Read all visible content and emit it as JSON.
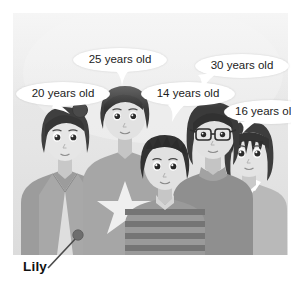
{
  "image": {
    "kind": "photo-illustration",
    "description": "Group of five cartoon people standing together against a plain light grey background",
    "panel_background": "#e6e6e6",
    "page_background": "#ffffff"
  },
  "callouts": {
    "bubbles": [
      {
        "id": "bubble-20",
        "label": "20 years old",
        "subject": "woman-with-bun",
        "x": 16,
        "y": 82,
        "w": 94,
        "h": 24,
        "tail_x": 62,
        "clipped": false
      },
      {
        "id": "bubble-25",
        "label": "25 years old",
        "subject": "tall-man",
        "x": 73,
        "y": 48,
        "w": 94,
        "h": 24,
        "tail_x": 120,
        "clipped": false
      },
      {
        "id": "bubble-14",
        "label": "14 years old",
        "subject": "boy-striped-shirt",
        "x": 141,
        "y": 82,
        "w": 94,
        "h": 24,
        "tail_x": 182,
        "clipped": false
      },
      {
        "id": "bubble-30",
        "label": "30 years old",
        "subject": "woman-with-glasses",
        "x": 195,
        "y": 54,
        "w": 94,
        "h": 24,
        "tail_x": 214,
        "clipped": false
      },
      {
        "id": "bubble-16",
        "label": "16 years old",
        "subject": "girl-bob-haircut",
        "x": 224,
        "y": 100,
        "w": 94,
        "h": 24,
        "tail_x": 250,
        "clipped": true
      }
    ]
  },
  "annotation": {
    "name_label": "Lily",
    "pointer_target": "leftmost-woman-shoulder",
    "dot_color": "#707070",
    "line_color": "#4a4a4a"
  },
  "people": [
    {
      "id": "woman-with-bun",
      "age_label": "20 years old",
      "is_named": true,
      "name": "Lily",
      "hair": "bun",
      "outfit": "light jacket"
    },
    {
      "id": "tall-man",
      "age_label": "25 years old",
      "is_named": false,
      "name": "",
      "hair": "short",
      "outfit": "star t-shirt"
    },
    {
      "id": "boy-striped-shirt",
      "age_label": "14 years old",
      "is_named": false,
      "name": "",
      "hair": "spiky",
      "outfit": "striped shirt"
    },
    {
      "id": "woman-with-glasses",
      "age_label": "30 years old",
      "is_named": false,
      "name": "",
      "hair": "bob",
      "outfit": "turtleneck",
      "accessory": "glasses"
    },
    {
      "id": "girl-bob-haircut",
      "age_label": "16 years old",
      "is_named": false,
      "name": "",
      "hair": "bob bangs",
      "outfit": "collared top"
    }
  ]
}
